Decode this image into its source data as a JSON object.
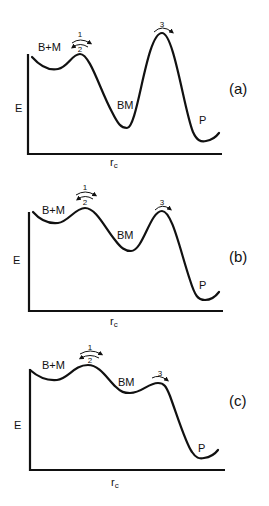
{
  "figure": {
    "panels": [
      {
        "id": "a",
        "panel_label": "(a)",
        "y_axis_label": "E",
        "x_axis_label": "r",
        "x_axis_subscript": "c",
        "state_labels": {
          "reactant": "B+M",
          "intermediate": "BM",
          "product": "P"
        },
        "arrow_labels": {
          "forward_1": "1",
          "reverse_2": "2",
          "step_3": "3"
        }
      },
      {
        "id": "b",
        "panel_label": "(b)",
        "y_axis_label": "E",
        "x_axis_label": "r",
        "x_axis_subscript": "c",
        "state_labels": {
          "reactant": "B+M",
          "intermediate": "BM",
          "product": "P"
        },
        "arrow_labels": {
          "forward_1": "1",
          "reverse_2": "2",
          "step_3": "3"
        }
      },
      {
        "id": "c",
        "panel_label": "(c)",
        "y_axis_label": "E",
        "x_axis_label": "r",
        "x_axis_subscript": "c",
        "state_labels": {
          "reactant": "B+M",
          "intermediate": "BM",
          "product": "P"
        },
        "arrow_labels": {
          "forward_1": "1",
          "reverse_2": "2",
          "step_3": "3"
        }
      }
    ],
    "colors": {
      "ink": "#111111",
      "background": "#ffffff"
    }
  }
}
